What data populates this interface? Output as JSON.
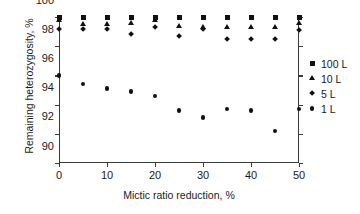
{
  "chart_data": {
    "type": "scatter",
    "title": "",
    "xlabel": "Mictic ratio reduction, %",
    "ylabel": "Remaining heterozygosity, %",
    "xlim": [
      0,
      50
    ],
    "ylim": [
      90,
      100
    ],
    "xticks": [
      0,
      10,
      20,
      30,
      40,
      50
    ],
    "yticks": [
      90,
      92,
      94,
      96,
      98,
      100
    ],
    "grid": false,
    "legend_position": "right",
    "x": [
      0,
      5,
      10,
      15,
      20,
      25,
      30,
      35,
      40,
      45,
      50
    ],
    "series": [
      {
        "name": "100 L",
        "marker": "square",
        "color": "#111111",
        "values": [
          100.0,
          100.0,
          100.0,
          100.0,
          100.0,
          100.0,
          100.0,
          100.0,
          100.0,
          100.0,
          100.0
        ]
      },
      {
        "name": "10 L",
        "marker": "triangle",
        "color": "#111111",
        "values": [
          99.8,
          99.5,
          99.5,
          99.6,
          99.8,
          99.4,
          99.3,
          99.3,
          99.3,
          99.3,
          99.6
        ]
      },
      {
        "name": "5 L",
        "marker": "diamond",
        "color": "#111111",
        "values": [
          99.2,
          99.2,
          99.2,
          98.8,
          99.3,
          98.7,
          99.2,
          98.5,
          98.5,
          98.5,
          99.1
        ]
      },
      {
        "name": "1 L",
        "marker": "circle",
        "color": "#111111",
        "values": [
          96.0,
          95.4,
          95.1,
          94.9,
          94.6,
          93.6,
          93.1,
          93.7,
          93.6,
          92.2,
          93.7
        ]
      }
    ]
  },
  "legend": {
    "items": [
      {
        "label": "100 L",
        "marker": "square"
      },
      {
        "label": "10 L",
        "marker": "triangle"
      },
      {
        "label": "5 L",
        "marker": "diamond"
      },
      {
        "label": "1 L",
        "marker": "circle"
      }
    ]
  }
}
